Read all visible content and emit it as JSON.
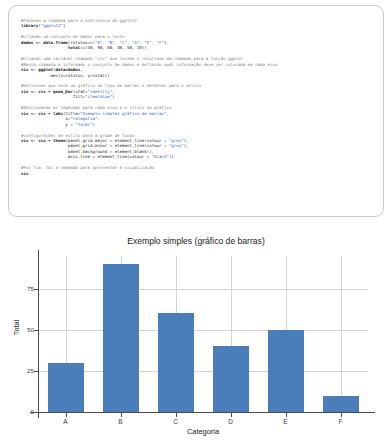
{
  "code": {
    "language": "R",
    "lines": [
      [
        {
          "t": "cmt",
          "s": "#Fazendo a chamada para a biblioteca do ggplot2"
        }
      ],
      [
        {
          "t": "kw",
          "s": "library"
        },
        {
          "t": "plain",
          "s": "("
        },
        {
          "t": "str",
          "s": "\"ggplot2\""
        },
        {
          "t": "plain",
          "s": ")"
        }
      ],
      [],
      [
        {
          "t": "cmt",
          "s": "#Criando um conjunto de dados para o teste"
        }
      ],
      [
        {
          "t": "kw",
          "s": "dados <- data.frame"
        },
        {
          "t": "plain",
          "s": "(rotulos=c("
        },
        {
          "t": "str",
          "s": "\"A\", \"B\", \"C\", \"D\", \"E\", \"F\""
        },
        {
          "t": "plain",
          "s": "),"
        }
      ],
      [
        {
          "t": "plain",
          "s": "                   "
        },
        {
          "t": "kw",
          "s": "total"
        },
        {
          "t": "plain",
          "s": "=c(30, 90, 60, 40, 50, 10))"
        }
      ],
      [],
      [
        {
          "t": "cmt",
          "s": "#Criando uma variável chamada \"vis\" que recebe o resultado da chamada para a função ggplot"
        }
      ],
      [
        {
          "t": "cmt",
          "s": "#Nessa chamada é informado o conjunto de dados e definido qual informação deve ser colocada em cada eixo"
        }
      ],
      [
        {
          "t": "kw",
          "s": "vis <- ggplot"
        },
        {
          "t": "plain",
          "s": "("
        },
        {
          "t": "kw",
          "s": "data=dados"
        },
        {
          "t": "plain",
          "s": ","
        }
      ],
      [
        {
          "t": "plain",
          "s": "            aes(x=rotulos, y=total))"
        }
      ],
      [],
      [
        {
          "t": "cmt",
          "s": "#Definindo que será um gráfico do tipo de barras e detalhes para o estilo"
        }
      ],
      [
        {
          "t": "kw",
          "s": "vis <- vis + geom_bar"
        },
        {
          "t": "plain",
          "s": "(stat="
        },
        {
          "t": "str",
          "s": "\"identity\""
        },
        {
          "t": "plain",
          "s": ","
        }
      ],
      [
        {
          "t": "plain",
          "s": "                     fill="
        },
        {
          "t": "str",
          "s": "\"steelblue\""
        },
        {
          "t": "plain",
          "s": ")"
        }
      ],
      [],
      [
        {
          "t": "cmt",
          "s": "#Adicionando as legendas para cada eixo e o título do gráfico"
        }
      ],
      [
        {
          "t": "kw",
          "s": "vis <- vis + labs"
        },
        {
          "t": "plain",
          "s": "(title="
        },
        {
          "t": "str",
          "s": "\"Exemplo simples gráfico de barras\""
        },
        {
          "t": "plain",
          "s": ","
        }
      ],
      [
        {
          "t": "plain",
          "s": "                  x="
        },
        {
          "t": "str",
          "s": "\"Categoria\""
        },
        {
          "t": "plain",
          "s": ","
        }
      ],
      [
        {
          "t": "plain",
          "s": "                  y = "
        },
        {
          "t": "str",
          "s": "\"Total\""
        },
        {
          "t": "plain",
          "s": ")"
        }
      ],
      [],
      [
        {
          "t": "cmt",
          "s": "#Configurações de estilo para a grade de fundo"
        }
      ],
      [
        {
          "t": "kw",
          "s": "vis <- vis + theme"
        },
        {
          "t": "plain",
          "s": "(panel.grid.major = element_line(colour = "
        },
        {
          "t": "str",
          "s": "\"grey\""
        },
        {
          "t": "plain",
          "s": "),"
        }
      ],
      [
        {
          "t": "plain",
          "s": "                   panel.grid.minor = element_line(colour = "
        },
        {
          "t": "str",
          "s": "\"grey\""
        },
        {
          "t": "plain",
          "s": "),"
        }
      ],
      [
        {
          "t": "plain",
          "s": "                   panel.background = element_blank(),"
        }
      ],
      [
        {
          "t": "plain",
          "s": "                   axis.line = element_line(colour = "
        },
        {
          "t": "str",
          "s": "\"black\""
        },
        {
          "t": "plain",
          "s": "))"
        }
      ],
      [],
      [
        {
          "t": "cmt",
          "s": "#Por fim, faz a chamada para apresentar a visualização"
        }
      ],
      [
        {
          "t": "kw",
          "s": "vis"
        }
      ]
    ]
  },
  "chart_data": {
    "type": "bar",
    "title": "Exemplo simples (gráfico de barras)",
    "xlabel": "Categoria",
    "ylabel": "Total",
    "categories": [
      "A",
      "B",
      "C",
      "D",
      "E",
      "F"
    ],
    "values": [
      30,
      90,
      60,
      40,
      50,
      10
    ],
    "ylim": [
      0,
      95
    ],
    "yticks": [
      0,
      25,
      50,
      75
    ],
    "ytick_labels": [
      "0",
      "25",
      "50",
      "75"
    ],
    "grid": true,
    "legend": "none",
    "bar_color": "#4a7ebb",
    "grid_color": "#d4d4d4",
    "axis_color": "#4a4a4a",
    "background": "#ffffff"
  }
}
